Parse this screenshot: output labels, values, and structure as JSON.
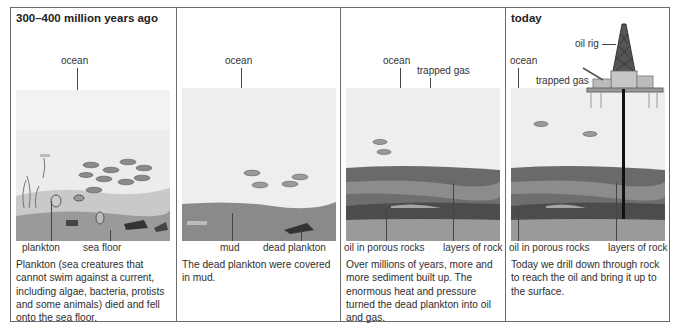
{
  "panels": [
    {
      "title": "300–400 million years ago",
      "labels": {
        "ocean": "ocean",
        "plankton": "plankton",
        "sea_floor": "sea floor"
      },
      "description": "Plankton (sea creatures that cannot swim against a current, including algae, bacteria, protists and some animals) died and fell onto the sea floor."
    },
    {
      "title": "",
      "labels": {
        "ocean": "ocean",
        "mud": "mud",
        "dead_plankton": "dead plankton"
      },
      "description": "The dead plankton were covered in mud."
    },
    {
      "title": "",
      "labels": {
        "ocean": "ocean",
        "trapped_gas": "trapped gas",
        "oil": "oil in porous rocks",
        "rock_layers": "layers of rock"
      },
      "description": "Over millions of years, more and more sediment built up. The enormous heat and pressure turned the dead plankton into oil and gas."
    },
    {
      "title": "today",
      "labels": {
        "oil_rig": "oil rig",
        "ocean": "ocean",
        "trapped_gas": "trapped gas",
        "oil": "oil in porous rocks",
        "rock_layers": "layers of rock"
      },
      "description": "Today we drill down through rock to reach the oil and bring it up to the surface."
    }
  ],
  "colors": {
    "border": "#6d6d6d",
    "water": "#ececec",
    "mud": "#8a8a8a",
    "rock_dark": "#6a6a6a",
    "rock_mid": "#8c8c8c",
    "rock_light": "#a6a6a6",
    "oil_layer": "#4c4c4c",
    "bedrock": "#9a9a9a"
  }
}
